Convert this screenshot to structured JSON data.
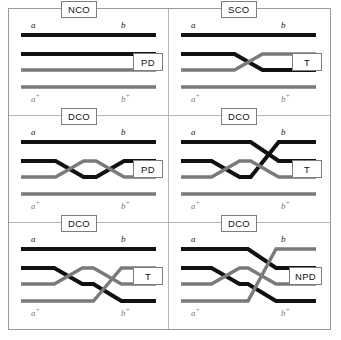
{
  "figure": {
    "title_hidden": "Crossover configurations and tetrad types",
    "colors": {
      "strand_dark": "#111111",
      "strand_gray": "#7a7a7a",
      "frame": "#9a9a9a",
      "divider": "#b5b5b5",
      "box_border": "#7d7d7d",
      "background": "#ffffff"
    },
    "strand_labels": {
      "top_left": "a",
      "top_right": "b",
      "bottom_left": "a",
      "bottom_left_sup": "+",
      "bottom_right": "b",
      "bottom_right_sup": "+"
    },
    "legend_note": "Four chromatid strands per panel: two dark (a/b) and two gray (a+/b+)"
  },
  "panels": [
    {
      "id": "panel-nco-pd",
      "crossover_label": "NCO",
      "tetrad_type": "T_label_unused",
      "type_label": "PD",
      "row": 0,
      "col": 0,
      "crossovers": [],
      "description": "No crossover; all four strands parallel"
    },
    {
      "id": "panel-sco-t",
      "crossover_label": "SCO",
      "type_label": "T",
      "row": 0,
      "col": 1,
      "crossovers": [
        {
          "x_fraction": 0.5,
          "strands": [
            2,
            3
          ]
        }
      ],
      "description": "Single crossover between strands 2 and 3"
    },
    {
      "id": "panel-dco-pd",
      "crossover_label": "DCO",
      "type_label": "PD",
      "row": 1,
      "col": 0,
      "crossovers": [
        {
          "x_fraction": 0.36,
          "strands": [
            2,
            3
          ]
        },
        {
          "x_fraction": 0.66,
          "strands": [
            2,
            3
          ]
        }
      ],
      "description": "Two-strand double crossover between strands 2 and 3"
    },
    {
      "id": "panel-dco-t-upper",
      "crossover_label": "DCO",
      "type_label": "T",
      "row": 1,
      "col": 1,
      "crossovers": [
        {
          "x_fraction": 0.33,
          "strands": [
            2,
            3
          ]
        },
        {
          "x_fraction": 0.62,
          "strands": [
            1,
            2,
            3
          ]
        }
      ],
      "description": "Three-strand double crossover involving strands 1, 2 and 3"
    },
    {
      "id": "panel-dco-t-lower",
      "crossover_label": "DCO",
      "type_label": "T",
      "row": 2,
      "col": 0,
      "crossovers": [
        {
          "x_fraction": 0.35,
          "strands": [
            2,
            3
          ]
        },
        {
          "x_fraction": 0.64,
          "strands": [
            2,
            3,
            4
          ]
        }
      ],
      "description": "Three-strand double crossover involving strands 2, 3 and 4"
    },
    {
      "id": "panel-dco-npd",
      "crossover_label": "DCO",
      "type_label": "NPD",
      "row": 2,
      "col": 1,
      "crossovers": [
        {
          "x_fraction": 0.33,
          "strands": [
            2,
            3
          ]
        },
        {
          "x_fraction": 0.6,
          "strands": [
            1,
            2,
            3,
            4
          ]
        }
      ],
      "description": "Four-strand double crossover involving all strands"
    }
  ]
}
